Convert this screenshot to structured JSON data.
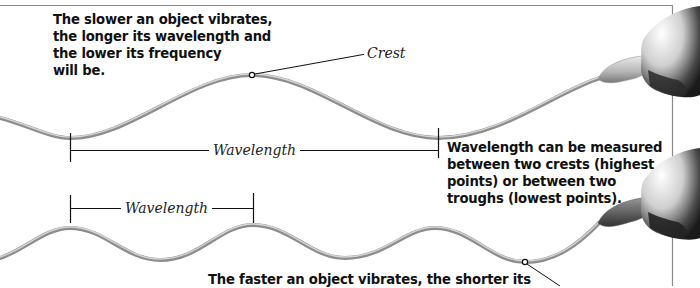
{
  "diagram": {
    "title_notes": {
      "slow_vibration": "The slower an object vibrates,\nthe longer its wavelength and\nthe lower its frequency\nwill be.",
      "measurement": "Wavelength can be measured\nbetween two crests (highest\npoints) or between two\ntroughs (lowest points).",
      "fast_vibration": "The faster an object vibrates, the shorter its"
    },
    "labels": {
      "crest": "Crest",
      "wavelength_long": "Wavelength",
      "wavelength_short": "Wavelength"
    },
    "waves": [
      {
        "name": "long-wave",
        "description": "slow vibration, long wavelength, low frequency"
      },
      {
        "name": "short-wave",
        "description": "fast vibration, short wavelength, high frequency"
      }
    ],
    "icons": [
      "hand-icon-top",
      "hand-icon-bottom"
    ],
    "colors": {
      "rope": "#9a9a9a",
      "rope_highlight": "#d8d8d8",
      "text": "#111111",
      "border": "#888888"
    }
  }
}
